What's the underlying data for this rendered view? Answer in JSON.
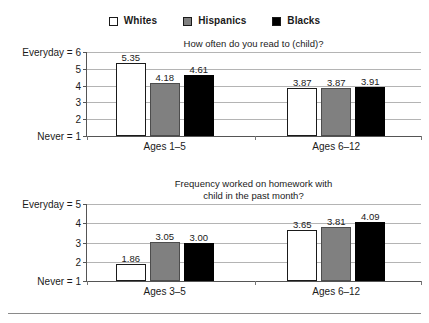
{
  "legend": {
    "items": [
      {
        "label": "Whites",
        "swatch": "white",
        "color": "#ffffff"
      },
      {
        "label": "Hispanics",
        "swatch": "gray",
        "color": "#808080"
      },
      {
        "label": "Blacks",
        "swatch": "black",
        "color": "#000000"
      }
    ]
  },
  "chart_data": [
    {
      "id": "read",
      "type": "bar",
      "title": "How often do you read to (child)?",
      "xlabel": "",
      "ylabel": "",
      "ylim": [
        1,
        6
      ],
      "yticks": [
        1,
        2,
        3,
        4,
        5,
        6
      ],
      "ytick_labels": [
        "Never = 1",
        "2",
        "3",
        "4",
        "5",
        "Everyday = 6"
      ],
      "grid": true,
      "legend_position": "top-center",
      "categories": [
        "Ages 1–5",
        "Ages 6–12"
      ],
      "series": [
        {
          "name": "Whites",
          "color": "#ffffff",
          "values": [
            5.35,
            3.87
          ]
        },
        {
          "name": "Hispanics",
          "color": "#808080",
          "values": [
            4.18,
            3.87
          ]
        },
        {
          "name": "Blacks",
          "color": "#000000",
          "values": [
            4.61,
            3.91
          ]
        }
      ],
      "value_labels": [
        [
          "5.35",
          "4.18",
          "4.61"
        ],
        [
          "3.87",
          "3.87",
          "3.91"
        ]
      ]
    },
    {
      "id": "homework",
      "type": "bar",
      "title": "Frequency worked on homework with child in the past month?",
      "title_lines": [
        "Frequency worked on homework with",
        "child in the past month?"
      ],
      "xlabel": "",
      "ylabel": "",
      "ylim": [
        1,
        5
      ],
      "yticks": [
        1,
        2,
        3,
        4,
        5
      ],
      "ytick_labels": [
        "Never = 1",
        "2",
        "3",
        "4",
        "Everyday = 5"
      ],
      "grid": true,
      "legend_position": "top-center",
      "categories": [
        "Ages 3–5",
        "Ages 6–12"
      ],
      "series": [
        {
          "name": "Whites",
          "color": "#ffffff",
          "values": [
            1.86,
            3.65
          ]
        },
        {
          "name": "Hispanics",
          "color": "#808080",
          "values": [
            3.05,
            3.81
          ]
        },
        {
          "name": "Blacks",
          "color": "#000000",
          "values": [
            3.0,
            4.09
          ]
        }
      ],
      "value_labels": [
        [
          "1.86",
          "3.05",
          "3.00"
        ],
        [
          "3.65",
          "3.81",
          "4.09"
        ]
      ]
    }
  ]
}
